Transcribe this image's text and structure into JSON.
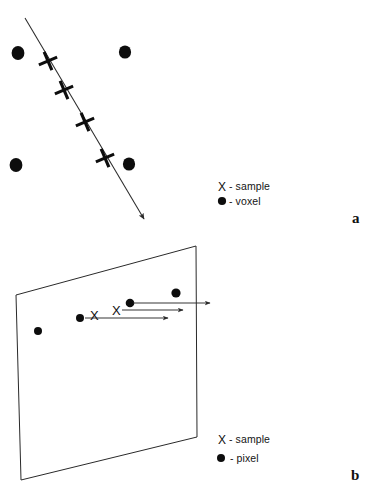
{
  "figure": {
    "background_color": "#ffffff",
    "ink_color": "#0d0d0d",
    "line_color": "#2a2a2a",
    "panels": [
      {
        "id": "panel-a",
        "letter": "a",
        "letter_pos": {
          "x": 352,
          "y": 223
        },
        "legend": [
          {
            "symbol": "X",
            "separator": "-",
            "label": "sample",
            "text": "- sample"
          },
          {
            "symbol": "dot",
            "separator": "-",
            "label": "voxel",
            "text": "- voxel"
          }
        ],
        "legend_pos": {
          "x": 218,
          "y": 189
        },
        "voxels": [
          {
            "x": 18,
            "y": 53,
            "r": 6.2
          },
          {
            "x": 125,
            "y": 52,
            "r": 6.0
          },
          {
            "x": 16,
            "y": 165,
            "r": 6.2
          },
          {
            "x": 129,
            "y": 164,
            "r": 6.0
          }
        ],
        "ray": {
          "x1": 25,
          "y1": 18,
          "x2": 146,
          "y2": 222,
          "arrow": "end"
        },
        "samples": [
          {
            "x": 48,
            "y": 61
          },
          {
            "x": 64,
            "y": 90
          },
          {
            "x": 85,
            "y": 122
          },
          {
            "x": 105,
            "y": 158
          }
        ]
      },
      {
        "id": "panel-b",
        "letter": "b",
        "letter_pos": {
          "x": 351,
          "y": 480
        },
        "legend": [
          {
            "symbol": "X",
            "separator": "-",
            "label": "sample",
            "text": "- sample"
          },
          {
            "symbol": "dot",
            "separator": "-",
            "label": "pixel",
            "text": "- pixel"
          }
        ],
        "legend_pos": {
          "x": 218,
          "y": 442
        },
        "plane": {
          "points": "16,295 196,246 197,437 21,480",
          "corners": [
            {
              "x": 16,
              "y": 295
            },
            {
              "x": 196,
              "y": 246
            },
            {
              "x": 197,
              "y": 437
            },
            {
              "x": 21,
              "y": 480
            }
          ]
        },
        "pixels": [
          {
            "x": 38,
            "y": 331,
            "r": 4.0
          },
          {
            "x": 80,
            "y": 318,
            "r": 4.0
          },
          {
            "x": 130,
            "y": 303,
            "r": 4.2
          },
          {
            "x": 176,
            "y": 293,
            "r": 4.6
          }
        ],
        "samples": [
          {
            "x": 96,
            "y": 315,
            "text": "X"
          },
          {
            "x": 118,
            "y": 310,
            "text": "X"
          }
        ],
        "arrows": [
          {
            "x1": 132,
            "y1": 303,
            "x2": 212,
            "y2": 303
          },
          {
            "x1": 120,
            "y1": 310,
            "x2": 185,
            "y2": 310
          },
          {
            "x1": 84,
            "y1": 318,
            "x2": 170,
            "y2": 318
          }
        ]
      }
    ]
  }
}
